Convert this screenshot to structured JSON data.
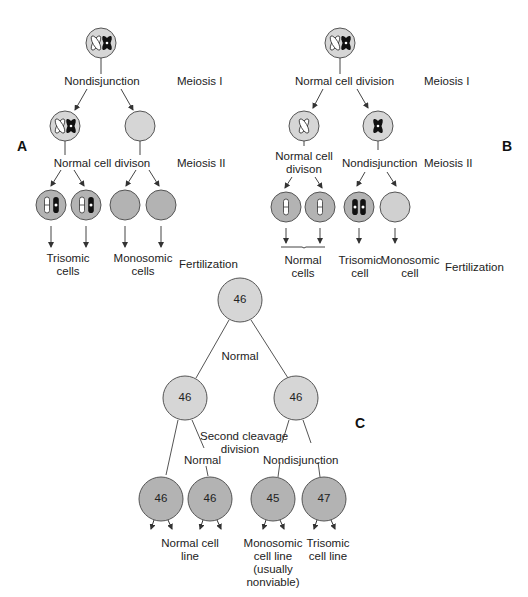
{
  "colors": {
    "cell_light": "#d6d6d6",
    "cell_dark": "#b3b3b3",
    "outline": "#555555",
    "line": "#444444"
  },
  "panel_a": {
    "letter": "A",
    "stage1": "Nondisjunction",
    "stage1_phase": "Meiosis I",
    "stage2": "Normal cell divison",
    "stage2_phase": "Meiosis II",
    "out_left": [
      "Trisomic",
      "cells"
    ],
    "out_right": [
      "Monosomic",
      "cells"
    ],
    "fert": "Fertilization"
  },
  "panel_b": {
    "letter": "B",
    "stage1": "Normal cell division",
    "stage1_phase": "Meiosis I",
    "stage2_left": [
      "Normal cell",
      "divison"
    ],
    "stage2_right": "Nondisjunction",
    "stage2_phase": "Meiosis II",
    "out_normal": [
      "Normal",
      "cells"
    ],
    "out_trisomic": [
      "Trisomic",
      "cell"
    ],
    "out_monosomic": [
      "Monosomic",
      "cell"
    ],
    "fert": "Fertilization"
  },
  "panel_c": {
    "letter": "C",
    "root": "46",
    "first_division": "Normal",
    "left_mid": "46",
    "right_mid": "46",
    "second_division": [
      "Second cleavage",
      "division"
    ],
    "left_branch_label": "Normal",
    "right_branch_label": "Nondisjunction",
    "leaves": [
      "46",
      "46",
      "45",
      "47"
    ],
    "out_normal": [
      "Normal cell",
      "line"
    ],
    "out_monosomic": [
      "Monosomic",
      "cell line",
      "(usually",
      "nonviable)"
    ],
    "out_trisomic": [
      "Trisomic",
      "cell line"
    ]
  }
}
